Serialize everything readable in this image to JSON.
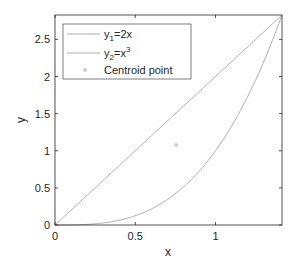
{
  "chart_data": {
    "type": "line",
    "title": "",
    "xlabel": "x",
    "ylabel": "y",
    "xlim": [
      0,
      1.4142
    ],
    "ylim": [
      0,
      2.8284
    ],
    "grid": false,
    "legend_position": "northwest",
    "x_ticks": [
      0,
      0.5,
      1
    ],
    "x_tick_labels": [
      "0",
      "0.5",
      "1"
    ],
    "y_ticks": [
      0,
      0.5,
      1,
      1.5,
      2,
      2.5
    ],
    "y_tick_labels": [
      "0",
      "0.5",
      "1",
      "1.5",
      "2",
      "2.5"
    ],
    "series": [
      {
        "name": "y1=2x",
        "legend_main": "y",
        "legend_sub": "1",
        "legend_rest": "=2x",
        "legend_sup": "",
        "type": "line",
        "expression": "2x",
        "color": "#9a9a9a",
        "x": [
          0,
          0.2,
          0.4,
          0.6,
          0.8,
          1.0,
          1.2,
          1.4142
        ],
        "values": [
          0,
          0.4,
          0.8,
          1.2,
          1.6,
          2.0,
          2.4,
          2.8284
        ]
      },
      {
        "name": "y2=x^3",
        "legend_main": "y",
        "legend_sub": "2",
        "legend_rest": "=x",
        "legend_sup": "3",
        "type": "line",
        "expression": "x^3",
        "color": "#9a9a9a",
        "x": [
          0,
          0.2,
          0.4,
          0.6,
          0.8,
          1.0,
          1.2,
          1.4142
        ],
        "values": [
          0,
          0.008,
          0.064,
          0.216,
          0.512,
          1.0,
          1.728,
          2.8284
        ]
      },
      {
        "name": "Centroid point",
        "legend_label": "Centroid point",
        "type": "scatter",
        "color": "#d0d0d0",
        "x": [
          0.7542
        ],
        "values": [
          1.0774
        ]
      }
    ]
  }
}
